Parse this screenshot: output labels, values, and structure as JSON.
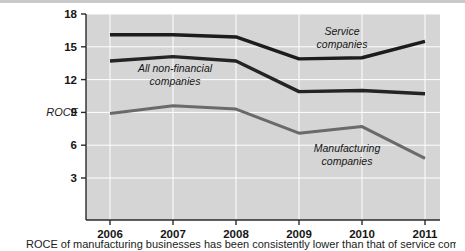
{
  "chart_data": {
    "type": "line",
    "title": "",
    "xlabel": "",
    "ylabel": "ROCE",
    "categories": [
      "2006",
      "2007",
      "2008",
      "2009",
      "2010",
      "2011"
    ],
    "x": [
      2006,
      2007,
      2008,
      2009,
      2010,
      2011
    ],
    "ylim": [
      0,
      18
    ],
    "xlim": [
      2005.6,
      2011.35
    ],
    "yticks": [
      3,
      6,
      9,
      12,
      15,
      18
    ],
    "ytick_labels": [
      "3",
      "6",
      "9",
      "12",
      "15",
      "18"
    ],
    "xtick_labels": [
      "2006",
      "2007",
      "2008",
      "2009",
      "2010",
      "2011"
    ],
    "grid": true,
    "grid_color": "#ffffff",
    "plot_background": "#d5d5d5",
    "legend": "inline-annotations",
    "series": [
      {
        "name": "Service companies",
        "values": [
          16.1,
          16.1,
          15.9,
          13.9,
          14.0,
          15.5
        ],
        "color": "#1c1c1c",
        "width": 3.4
      },
      {
        "name": "All non-financial companies",
        "values": [
          13.7,
          14.1,
          13.7,
          10.9,
          11.0,
          10.7
        ],
        "color": "#242424",
        "width": 3.4
      },
      {
        "name": "Manufacturing companies",
        "values": [
          8.9,
          9.6,
          9.3,
          7.1,
          7.7,
          4.8
        ],
        "color": "#6a6a6a",
        "width": 3.0
      }
    ],
    "annotations": [
      {
        "text_line1": "Service",
        "text_line2": "companies",
        "x": 342,
        "y": 35
      },
      {
        "text_line1": "All non-financial",
        "text_line2": "companies",
        "x": 175,
        "y": 72
      },
      {
        "text_line1": "Manufacturing",
        "text_line2": "companies",
        "x": 347,
        "y": 152
      }
    ]
  },
  "axis": {
    "y_title": "ROCE"
  },
  "caption": {
    "text": "ROCE of manufacturing businesses has been consistently lower than that of service com"
  }
}
